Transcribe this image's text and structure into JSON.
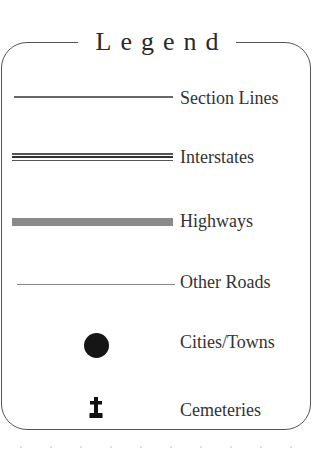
{
  "legend": {
    "title": "Legend",
    "items": [
      {
        "label": "Section Lines",
        "symbol": "thin-line"
      },
      {
        "label": "Interstates",
        "symbol": "triple-line"
      },
      {
        "label": "Highways",
        "symbol": "thick-gray-band"
      },
      {
        "label": "Other Roads",
        "symbol": "hairline"
      },
      {
        "label": "Cities/Towns",
        "symbol": "filled-circle"
      },
      {
        "label": "Cemeteries",
        "symbol": "cross-on-base"
      }
    ]
  },
  "colors": {
    "border": "#555555",
    "highway": "#8a8a8a",
    "city_dot": "#151515",
    "text": "#333333"
  }
}
